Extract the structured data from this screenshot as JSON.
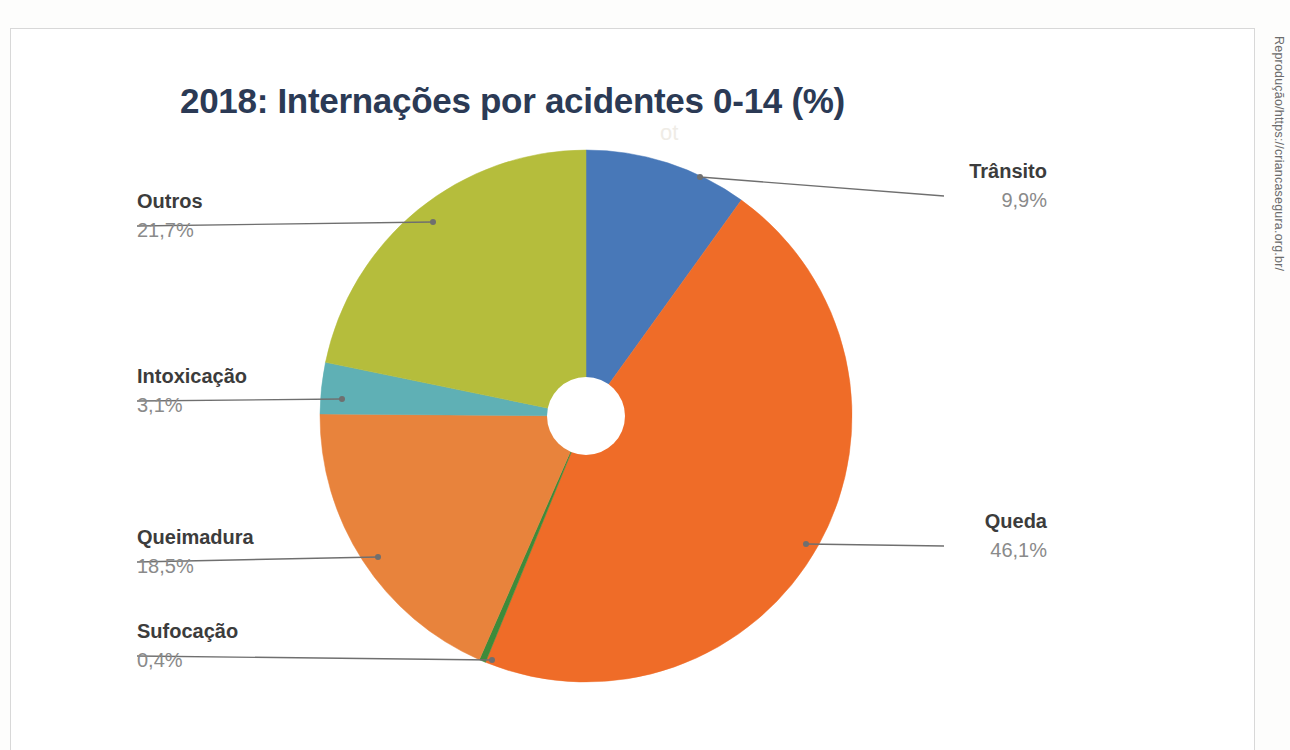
{
  "document": {
    "title": "2018: Internações por acidentes 0-14 (%)",
    "credit": "Reprodução/https://criancasegura.org.br/",
    "title_color": "#2b3a55",
    "frame_color": "#d8d8d8",
    "background": "#ffffff"
  },
  "chart_data": {
    "type": "pie",
    "title": "2018: Internações por acidentes 0-14 (%)",
    "subtitle": "",
    "xlabel": "",
    "ylabel": "",
    "donut": true,
    "hole_ratio": 0.145,
    "start_angle_deg": 0,
    "direction": "clockwise",
    "legend": "none",
    "value_suffix": "%",
    "decimal_separator": ",",
    "categories": [
      "Trânsito",
      "Queda",
      "Sufocação",
      "Queimadura",
      "Intoxicação",
      "Outros"
    ],
    "values": [
      9.9,
      46.1,
      0.4,
      18.5,
      3.1,
      21.7
    ],
    "value_labels": [
      "9,9%",
      "46,1%",
      "0,4%",
      "18,5%",
      "3,1%",
      "21,7%"
    ],
    "colors": [
      "#4878b8",
      "#ef6c28",
      "#3e8b3a",
      "#e8833c",
      "#5fb0b5",
      "#b5bd3c"
    ],
    "total": 99.7,
    "slices": [
      {
        "name": "Trânsito",
        "value": 9.9,
        "value_label": "9,9%",
        "color": "#4878b8",
        "label_align": "right",
        "label_x": 1047,
        "label_y": 158,
        "leader_x": 944,
        "leader_y": 196,
        "anchor_x": 700,
        "anchor_y": 177
      },
      {
        "name": "Queda",
        "value": 46.1,
        "value_label": "46,1%",
        "color": "#ef6c28",
        "label_align": "right",
        "label_x": 1047,
        "label_y": 508,
        "leader_x": 944,
        "leader_y": 546,
        "anchor_x": 806,
        "anchor_y": 544
      },
      {
        "name": "Sufocação",
        "value": 0.4,
        "value_label": "0,4%",
        "color": "#3e8b3a",
        "label_align": "left",
        "label_x": 137,
        "label_y": 618,
        "leader_x": 137,
        "leader_y": 656,
        "anchor_x": 492,
        "anchor_y": 660
      },
      {
        "name": "Queimadura",
        "value": 18.5,
        "value_label": "18,5%",
        "color": "#e8833c",
        "label_align": "left",
        "label_x": 137,
        "label_y": 524,
        "leader_x": 137,
        "leader_y": 562,
        "anchor_x": 378,
        "anchor_y": 557
      },
      {
        "name": "Intoxicação",
        "value": 3.1,
        "value_label": "3,1%",
        "color": "#5fb0b5",
        "label_align": "left",
        "label_x": 137,
        "label_y": 363,
        "leader_x": 137,
        "leader_y": 401,
        "anchor_x": 342,
        "anchor_y": 399
      },
      {
        "name": "Outros",
        "value": 21.7,
        "value_label": "21,7%",
        "color": "#b5bd3c",
        "label_align": "left",
        "label_x": 137,
        "label_y": 188,
        "leader_x": 137,
        "leader_y": 226,
        "anchor_x": 433,
        "anchor_y": 222
      }
    ],
    "geometry": {
      "center_x": 586,
      "center_y": 416,
      "radius": 266,
      "hole_radius": 39
    }
  }
}
